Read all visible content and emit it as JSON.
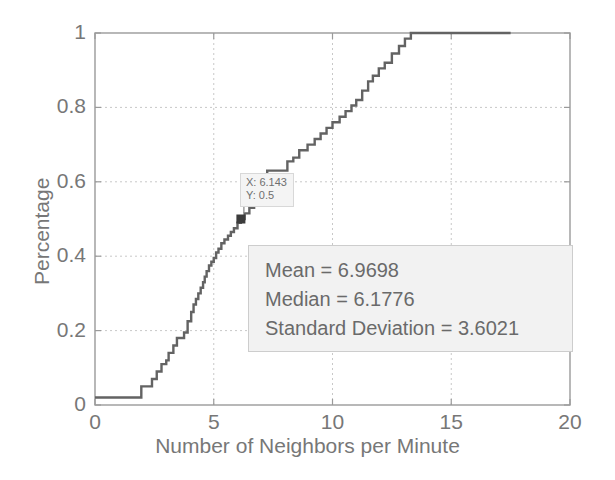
{
  "chart_data": {
    "type": "line",
    "title": "",
    "xlabel": "Number of Neighbors per Minute",
    "ylabel": "Percentage",
    "xlim": [
      0,
      20
    ],
    "ylim": [
      0,
      1
    ],
    "xticks": [
      "0",
      "5",
      "10",
      "15",
      "20"
    ],
    "xtick_values": [
      0,
      5,
      10,
      15,
      20
    ],
    "yticks": [
      "0",
      "0.2",
      "0.4",
      "0.6",
      "0.8",
      "1"
    ],
    "ytick_values": [
      0,
      0.2,
      0.4,
      0.6,
      0.8,
      1
    ],
    "grid": true,
    "legend": "none",
    "series": [
      {
        "name": "Empirical CDF",
        "style": "step",
        "color": "#636363",
        "x": [
          0.0,
          1.85,
          1.95,
          2.25,
          2.4,
          2.6,
          2.8,
          3.0,
          3.1,
          3.3,
          3.45,
          3.75,
          3.9,
          4.05,
          4.15,
          4.25,
          4.35,
          4.45,
          4.55,
          4.62,
          4.7,
          4.8,
          4.9,
          5.0,
          5.1,
          5.2,
          5.32,
          5.45,
          5.6,
          5.72,
          5.85,
          6.0,
          6.143,
          6.3,
          6.5,
          6.7,
          6.95,
          7.25,
          7.9,
          8.1,
          8.35,
          8.6,
          8.95,
          9.25,
          9.5,
          9.75,
          10.0,
          10.3,
          10.55,
          10.8,
          11.0,
          11.25,
          11.5,
          11.7,
          11.95,
          12.2,
          12.5,
          12.8,
          13.05,
          13.3,
          17.5
        ],
        "y": [
          0.02,
          0.02,
          0.05,
          0.05,
          0.07,
          0.09,
          0.11,
          0.12,
          0.14,
          0.16,
          0.18,
          0.195,
          0.225,
          0.25,
          0.27,
          0.285,
          0.3,
          0.315,
          0.33,
          0.345,
          0.36,
          0.375,
          0.385,
          0.395,
          0.41,
          0.42,
          0.435,
          0.445,
          0.455,
          0.465,
          0.475,
          0.49,
          0.5,
          0.515,
          0.53,
          0.545,
          0.56,
          0.63,
          0.63,
          0.655,
          0.665,
          0.685,
          0.7,
          0.715,
          0.73,
          0.745,
          0.76,
          0.775,
          0.79,
          0.805,
          0.82,
          0.845,
          0.87,
          0.885,
          0.905,
          0.92,
          0.945,
          0.965,
          0.985,
          1.0,
          1.0
        ]
      }
    ],
    "annotations": {
      "datatip": {
        "x_label": "X: 6.143",
        "y_label": "Y: 0.5",
        "x_value": 6.143,
        "y_value": 0.5,
        "marker": "square"
      },
      "stats_box": {
        "lines": [
          "Mean = 6.9698",
          "Median = 6.1776",
          "Standard Deviation = 3.6021"
        ],
        "mean": 6.9698,
        "median": 6.1776,
        "standard_deviation": 3.6021
      }
    },
    "colors": {
      "curve": "#636363",
      "grid": "#c8c8c8",
      "axis": "#9a9a9a",
      "text": "#777777",
      "box_fill": "#f2f2f2",
      "box_border": "#cdcdcd"
    }
  }
}
